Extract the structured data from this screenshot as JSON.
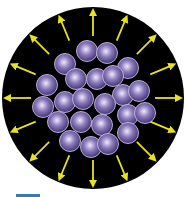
{
  "figure": {
    "circle": {
      "cx": 93,
      "cy": 98,
      "r": 91,
      "fill": "#000000"
    },
    "arrows": {
      "count": 16,
      "color": "#e6e21e",
      "inner_radius": 62,
      "outer_radius": 86,
      "start_angle_deg": 90
    },
    "particles": {
      "radius": 10.5,
      "highlight_color": "#f0eafa",
      "mid_color": "#8c7bbd",
      "edge_color": "#3e2f6e",
      "outline_color": "#c9bde6",
      "centers": [
        [
          87,
          51
        ],
        [
          107,
          53
        ],
        [
          65,
          64
        ],
        [
          128,
          68
        ],
        [
          76,
          79
        ],
        [
          97,
          79
        ],
        [
          113,
          76
        ],
        [
          47,
          85
        ],
        [
          123,
          95
        ],
        [
          139,
          91
        ],
        [
          43,
          107
        ],
        [
          65,
          102
        ],
        [
          83,
          99
        ],
        [
          105,
          104
        ],
        [
          128,
          115
        ],
        [
          145,
          113
        ],
        [
          58,
          122
        ],
        [
          81,
          122
        ],
        [
          102,
          125
        ],
        [
          128,
          133
        ],
        [
          70,
          141
        ],
        [
          91,
          147
        ],
        [
          108,
          144
        ]
      ]
    },
    "accent_bar_color": "#2a7fc0"
  }
}
